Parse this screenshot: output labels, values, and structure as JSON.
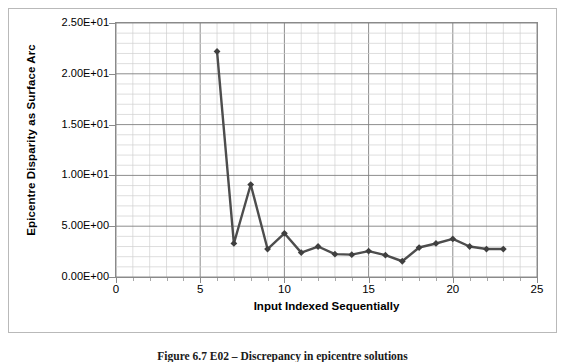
{
  "figure": {
    "caption": "Figure 6.7 E02 – Discrepancy in epicentre solutions"
  },
  "chart_data": {
    "type": "line",
    "title": "",
    "xlabel": "Input Indexed Sequentially",
    "ylabel": "Epicentre Disparity as Surface Arc",
    "xlim": [
      0,
      25
    ],
    "ylim": [
      0,
      25
    ],
    "xticks": [
      0,
      5,
      10,
      15,
      20,
      25
    ],
    "xtick_labels": [
      "0",
      "5",
      "10",
      "15",
      "20",
      "25"
    ],
    "yticks": [
      0,
      5,
      10,
      15,
      20,
      25
    ],
    "ytick_labels": [
      "0.00E+00",
      "5.00E+00",
      "1.00E+01",
      "1.50E+01",
      "2.00E+01",
      "2.50E+01"
    ],
    "x_minor_step": 1,
    "y_minor_step": 1,
    "grid": true,
    "grid_major_color": "#808080",
    "grid_minor_color": "#d0d0d0",
    "legend": false,
    "series": [
      {
        "name": "Epicentre Disparity",
        "line_color": "#4d4d4d",
        "marker": "diamond",
        "marker_color": "#3f3f3f",
        "x": [
          6,
          7,
          8,
          9,
          10,
          11,
          12,
          13,
          14,
          15,
          16,
          17,
          18,
          19,
          20,
          21,
          22,
          23
        ],
        "y": [
          22.2,
          3.3,
          9.1,
          2.75,
          4.3,
          2.4,
          3.0,
          2.25,
          2.2,
          2.55,
          2.15,
          1.55,
          2.9,
          3.3,
          3.75,
          3.0,
          2.75,
          2.75
        ]
      }
    ]
  }
}
